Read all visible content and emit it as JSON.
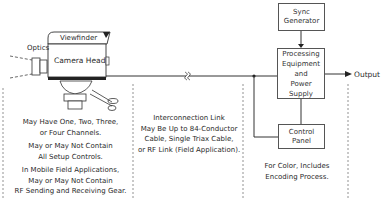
{
  "camera": {
    "viewfinder_label": "Viewfinder",
    "head_label": "Camera Head",
    "optics_label": "Optics"
  },
  "blocks": {
    "sync_generator": "Sync\nGenerator",
    "processing": "Processing\nEquipment\nand\nPower Supply",
    "control_panel": "Control\nPanel"
  },
  "output_label": "Output",
  "notes": {
    "camera": [
      "May Have One, Two, Three,\nor Four Channels.",
      "May or May Not Contain\nAll Setup Controls.",
      "In Mobile Field Applications,\nMay or May Not Contain\nRF Sending and Receiving Gear."
    ],
    "link": "Interconnection Link\nMay Be Up to 84-Conductor\nCable, Single Triax Cable,\nor RF Link (Field Application).",
    "control": "For Color, Includes\nEncoding Process."
  },
  "colors": {
    "line": "#333333",
    "dash": "#777777"
  }
}
